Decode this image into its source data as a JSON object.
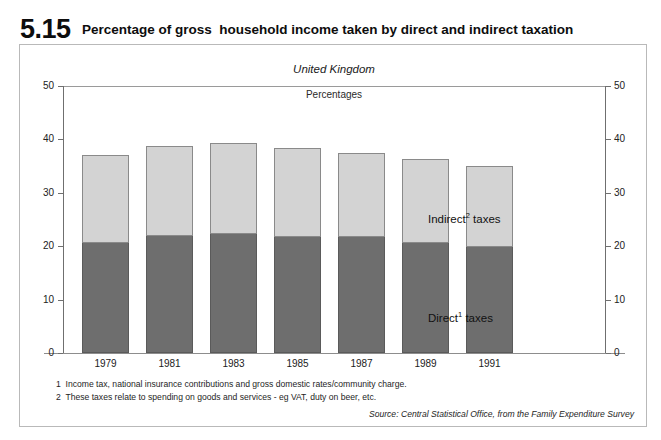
{
  "header": {
    "figure_number": "5.15",
    "title": "Percentage of gross  household income taken by direct and indirect taxation"
  },
  "subtitles": {
    "country": "United Kingdom",
    "units": "Percentages"
  },
  "legend": {
    "indirect_label": "Indirect",
    "indirect_sup": "2",
    "indirect_suffix": " taxes",
    "direct_label": "Direct",
    "direct_sup": "1",
    "direct_suffix": " taxes"
  },
  "notes": [
    "1  Income tax, national insurance contributions and gross domestic rates/community charge.",
    "2  These taxes relate to spending on goods and services - eg VAT, duty on beer, etc."
  ],
  "source": "Source: Central Statistical Office, from the Family Expenditure Survey",
  "colors": {
    "indirect": "#d3d3d3",
    "direct": "#6e6e6e",
    "axis": "#6f6f6f",
    "frame": "#b9b9b9"
  },
  "chart_data": {
    "type": "bar",
    "stacked": true,
    "title": "Percentage of gross household income taken by direct and indirect taxation",
    "subtitle": "United Kingdom",
    "xlabel": "",
    "ylabel": "Percentages",
    "ylim": [
      0,
      50
    ],
    "yticks": [
      0,
      10,
      20,
      30,
      40,
      50
    ],
    "ytick_labels": [
      "0",
      "10",
      "20",
      "30",
      "40",
      "50"
    ],
    "right_axis": true,
    "right_ytick_labels": [
      "0",
      "10",
      "20",
      "30",
      "40",
      "50"
    ],
    "grid": false,
    "legend_position": "right-inside",
    "categories": [
      "1979",
      "1981",
      "1983",
      "1985",
      "1987",
      "1989",
      "1991"
    ],
    "series": [
      {
        "name": "Direct taxes",
        "color": "#6e6e6e",
        "values": [
          20.6,
          21.9,
          22.2,
          21.8,
          21.7,
          20.6,
          19.9
        ]
      },
      {
        "name": "Indirect taxes",
        "color": "#d3d3d3",
        "values": [
          16.4,
          16.9,
          17.2,
          16.6,
          15.7,
          15.8,
          15.1
        ]
      }
    ],
    "totals": [
      37.0,
      38.8,
      39.4,
      38.4,
      37.4,
      36.4,
      35.0
    ]
  }
}
